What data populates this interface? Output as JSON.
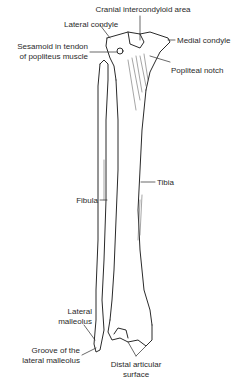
{
  "diagram": {
    "labels": {
      "cranial_intercondyloid_area": "Cranial intercondyloid area",
      "lateral_condyle": "Lateral condyle",
      "medial_condyle": "Medial condyle",
      "sesamoid_line1": "Sesamoid in tendon",
      "sesamoid_line2": "of popliteus muscle",
      "popliteal_notch": "Popliteal notch",
      "fibula": "Fibula",
      "tibia": "Tibia",
      "lateral_malleolus_line1": "Lateral",
      "lateral_malleolus_line2": "malleolus",
      "groove_line1": "Groove of the",
      "groove_line2": "lateral malleolus",
      "distal_articular_line1": "Distal articular",
      "distal_articular_line2": "surface"
    },
    "colors": {
      "ink": "#2a2a2a",
      "background": "#ffffff",
      "shade": "#6a6a6a"
    }
  }
}
